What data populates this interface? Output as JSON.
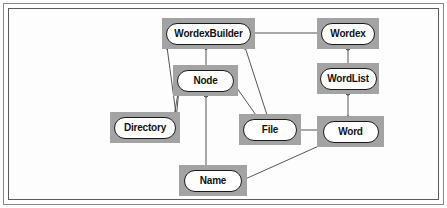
{
  "diagram": {
    "type": "object-model-diagram",
    "canvas": {
      "width": 447,
      "height": 208
    },
    "palette": {
      "page_background": "#ffffff",
      "box_fill": "#a3a3a3",
      "pill_fill": "#ffffff",
      "stroke": "#1a1a1a",
      "line": "#55555a",
      "frame_outer": "#8a8a8a",
      "frame_inner": "#5d5d5d"
    },
    "classes": [
      {
        "id": "wordexbuilder",
        "label": "WordexBuilder",
        "box": {
          "x": 162,
          "y": 18,
          "w": 93,
          "h": 31
        },
        "pill": {
          "w": 83,
          "h": 20,
          "font": 10
        }
      },
      {
        "id": "wordex",
        "label": "Wordex",
        "box": {
          "x": 317,
          "y": 18,
          "w": 62,
          "h": 31
        },
        "pill": {
          "w": 52,
          "h": 20,
          "font": 10
        }
      },
      {
        "id": "node",
        "label": "Node",
        "box": {
          "x": 173,
          "y": 65,
          "w": 65,
          "h": 31
        },
        "pill": {
          "w": 55,
          "h": 20,
          "font": 10
        }
      },
      {
        "id": "wordlist",
        "label": "WordList",
        "box": {
          "x": 317,
          "y": 63,
          "w": 62,
          "h": 31
        },
        "pill": {
          "w": 55,
          "h": 20,
          "font": 10
        }
      },
      {
        "id": "directory",
        "label": "Directory",
        "box": {
          "x": 110,
          "y": 112,
          "w": 70,
          "h": 31
        },
        "pill": {
          "w": 60,
          "h": 20,
          "font": 10
        }
      },
      {
        "id": "file",
        "label": "File",
        "box": {
          "x": 239,
          "y": 114,
          "w": 62,
          "h": 31
        },
        "pill": {
          "w": 52,
          "h": 20,
          "font": 10
        }
      },
      {
        "id": "word",
        "label": "Word",
        "box": {
          "x": 317,
          "y": 116,
          "w": 67,
          "h": 31
        },
        "pill": {
          "w": 54,
          "h": 20,
          "font": 10
        }
      },
      {
        "id": "name",
        "label": "Name",
        "box": {
          "x": 179,
          "y": 165,
          "w": 68,
          "h": 31
        },
        "pill": {
          "w": 56,
          "h": 20,
          "font": 10
        }
      }
    ],
    "associations": [
      {
        "id": "wordexbuilder-wordex",
        "from": "wordexbuilder",
        "to": "wordex",
        "from_marker": "none",
        "to_marker": "hollow-circle",
        "path": "M 250 33 L 322 33"
      },
      {
        "id": "wordexbuilder-directory",
        "from": "wordexbuilder",
        "to": "directory",
        "from_marker": "hollow-circle",
        "to_marker": "hollow-circle",
        "path": "M 167 47 L 176 114"
      },
      {
        "id": "wordexbuilder-node",
        "from": "wordexbuilder",
        "to": "node",
        "from_marker": "filled-circle",
        "to_marker": "none",
        "path": "M 206 47 L 206 67"
      },
      {
        "id": "wordexbuilder-file",
        "from": "wordexbuilder",
        "to": "file",
        "from_marker": "hollow-circle",
        "to_marker": "none",
        "path": "M 245 47 L 268 118"
      },
      {
        "id": "node-directory-a",
        "from": "node",
        "to": "directory",
        "from_marker": "filled-circle",
        "to_marker": "hollow-circle",
        "path": "M 180 79 L 176 120"
      },
      {
        "id": "node-directory-b",
        "from": "node",
        "to": "directory",
        "from_marker": "filled-circle",
        "to_marker": "none",
        "path": "M 180 82 L 173 122"
      },
      {
        "id": "node-name",
        "from": "node",
        "to": "name",
        "from_marker": "hollow-circle",
        "to_marker": "none",
        "path": "M 206 94 L 206 167"
      },
      {
        "id": "node-file",
        "from": "node",
        "to": "file",
        "from_marker": "filled-circle",
        "to_marker": "none",
        "path": "M 232 81 L 258 118"
      },
      {
        "id": "wordex-wordlist",
        "from": "wordex",
        "to": "wordlist",
        "from_marker": "hollow-circle",
        "to_marker": "none",
        "path": "M 348 47 L 348 65"
      },
      {
        "id": "wordlist-word",
        "from": "wordlist",
        "to": "word",
        "from_marker": "hollow-circle",
        "to_marker": "none",
        "path": "M 348 92 L 348 118"
      },
      {
        "id": "file-word",
        "from": "file",
        "to": "word",
        "from_marker": "hollow-circle",
        "to_marker": "none",
        "path": "M 292 130 L 322 130"
      },
      {
        "id": "word-name",
        "from": "word",
        "to": "name",
        "from_marker": "hollow-circle",
        "to_marker": "none",
        "path": "M 330 141 L 243 180"
      }
    ],
    "markers": [
      {
        "id": "m-wordex-left",
        "kind": "hollow-circle",
        "x": 322,
        "y": 33
      },
      {
        "id": "m-wb-bottom-left",
        "kind": "hollow-circle",
        "x": 167,
        "y": 47
      },
      {
        "id": "m-wb-bottom-center",
        "kind": "filled-circle",
        "x": 206,
        "y": 47
      },
      {
        "id": "m-wb-bottom-right",
        "kind": "hollow-circle",
        "x": 245,
        "y": 47
      },
      {
        "id": "m-node-left",
        "kind": "filled-circle",
        "x": 180,
        "y": 80
      },
      {
        "id": "m-node-right",
        "kind": "filled-circle",
        "x": 232,
        "y": 81
      },
      {
        "id": "m-node-bottom",
        "kind": "hollow-circle",
        "x": 206,
        "y": 95
      },
      {
        "id": "m-directory-top",
        "kind": "hollow-circle",
        "x": 176,
        "y": 119
      },
      {
        "id": "m-wordex-bottom",
        "kind": "hollow-circle",
        "x": 348,
        "y": 48
      },
      {
        "id": "m-wordlist-bottom",
        "kind": "hollow-circle",
        "x": 348,
        "y": 93
      },
      {
        "id": "m-file-right",
        "kind": "hollow-circle",
        "x": 294,
        "y": 130
      },
      {
        "id": "m-word-top",
        "kind": "hollow-circle",
        "x": 348,
        "y": 118
      },
      {
        "id": "m-word-bottomleft",
        "kind": "hollow-circle",
        "x": 329,
        "y": 141
      }
    ]
  }
}
